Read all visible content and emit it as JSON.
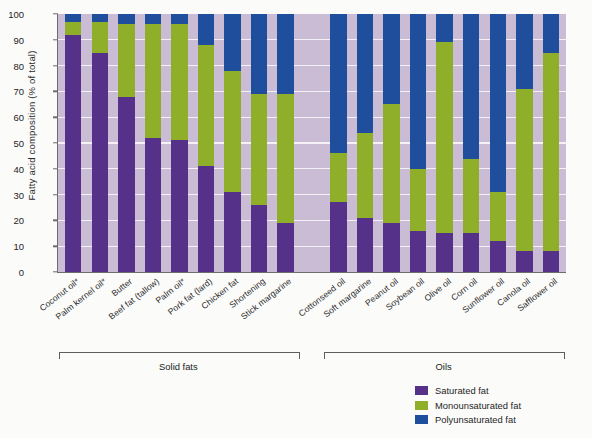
{
  "chart_data": {
    "type": "bar",
    "subtype": "stacked-bar-100-percent",
    "title": "",
    "xlabel": "",
    "ylabel": "Fatty acid composition (% of total)",
    "ylim": [
      0,
      100
    ],
    "yticks": [
      0,
      10,
      20,
      30,
      40,
      50,
      60,
      70,
      80,
      90,
      100
    ],
    "ytick_labels": [
      "0",
      "10",
      "20",
      "30",
      "40",
      "50",
      "60",
      "70",
      "80",
      "90",
      "100"
    ],
    "grid": true,
    "grid_axis": "y",
    "legend_position": "bottom-right",
    "plot_background": "#c9bcd4",
    "categories": [
      "Coconut oil*",
      "Palm kernel oil*",
      "Butter",
      "Beef fat (tallow)",
      "Palm oil*",
      "Pork fat (lard)",
      "Chicken fat",
      "Shortening",
      "Stick margarine",
      "Cottonseed oil",
      "Soft margarine",
      "Peanut oil",
      "Soybean oil",
      "Olive oil",
      "Corn oil",
      "Sunflower oil",
      "Canola oil",
      "Safflower oil"
    ],
    "series": [
      {
        "name": "Saturated fat",
        "color": "#553189",
        "values": [
          92,
          85,
          68,
          52,
          51,
          41,
          31,
          26,
          19,
          27,
          21,
          19,
          16,
          15,
          15,
          12,
          8,
          8
        ]
      },
      {
        "name": "Monounsaturated fat",
        "color": "#8fae2a",
        "values": [
          5,
          12,
          28,
          44,
          45,
          47,
          47,
          43,
          50,
          19,
          33,
          46,
          24,
          74,
          29,
          19,
          63,
          77
        ]
      },
      {
        "name": "Polyunsaturated fat",
        "color": "#1e4e9c",
        "values": [
          3,
          3,
          4,
          4,
          4,
          12,
          22,
          31,
          31,
          54,
          46,
          35,
          60,
          11,
          56,
          69,
          29,
          15
        ]
      }
    ],
    "groups": [
      {
        "label": "Solid fats",
        "start_index": 0,
        "end_index": 8
      },
      {
        "label": "Oils",
        "start_index": 9,
        "end_index": 17
      }
    ],
    "group_gap_after_index": 8,
    "legend": [
      {
        "label": "Saturated fat",
        "color": "#553189"
      },
      {
        "label": "Monounsaturated fat",
        "color": "#8fae2a"
      },
      {
        "label": "Polyunsaturated fat",
        "color": "#1e4e9c"
      }
    ]
  }
}
